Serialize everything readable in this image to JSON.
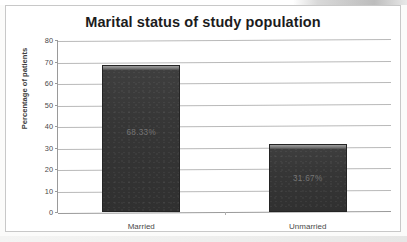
{
  "chart_data": {
    "type": "bar",
    "title": "Marital status of study population",
    "xlabel": "",
    "ylabel": "Percentage of patients",
    "categories": [
      "Married",
      "Unmarried"
    ],
    "values": [
      68.33,
      31.67
    ],
    "data_labels": [
      "68.33%",
      "31.67%"
    ],
    "ylim": [
      0,
      80
    ],
    "yticks": [
      0,
      10,
      20,
      30,
      40,
      50,
      60,
      70,
      80
    ],
    "ytick_labels": [
      "0",
      "10",
      "20",
      "30",
      "40",
      "50",
      "60",
      "70",
      "80"
    ],
    "grid": true,
    "legend": false,
    "bar_color": "#363636",
    "grid_color": "#b9b9b9",
    "title_color": "#1c1c1c",
    "axis_text_color": "#4a4a4a"
  },
  "chart": {
    "title": "Marital status of study population",
    "y_axis_title": "Percentage of patients",
    "bars": [
      {
        "category": "Married",
        "value": 68.33,
        "label": "68.33%"
      },
      {
        "category": "Unmarried",
        "value": 31.67,
        "label": "31.67%"
      }
    ]
  }
}
